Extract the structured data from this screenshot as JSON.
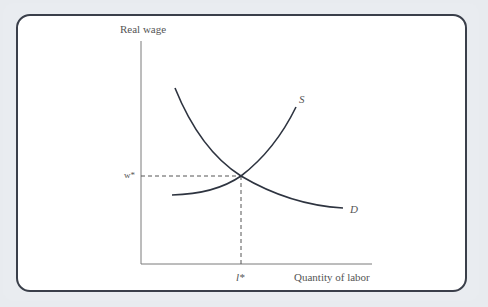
{
  "diagram": {
    "y_axis_label": "Real wage",
    "x_axis_label": "Quantity of labor",
    "equilibrium_wage_label": "w*",
    "equilibrium_quantity_label": "l*",
    "supply_label": "S",
    "demand_label": "D",
    "colors": {
      "curve": "#2e3440",
      "axis": "#6b6b6b",
      "border": "#3a3f4a",
      "background": "#e9ecf0"
    }
  }
}
